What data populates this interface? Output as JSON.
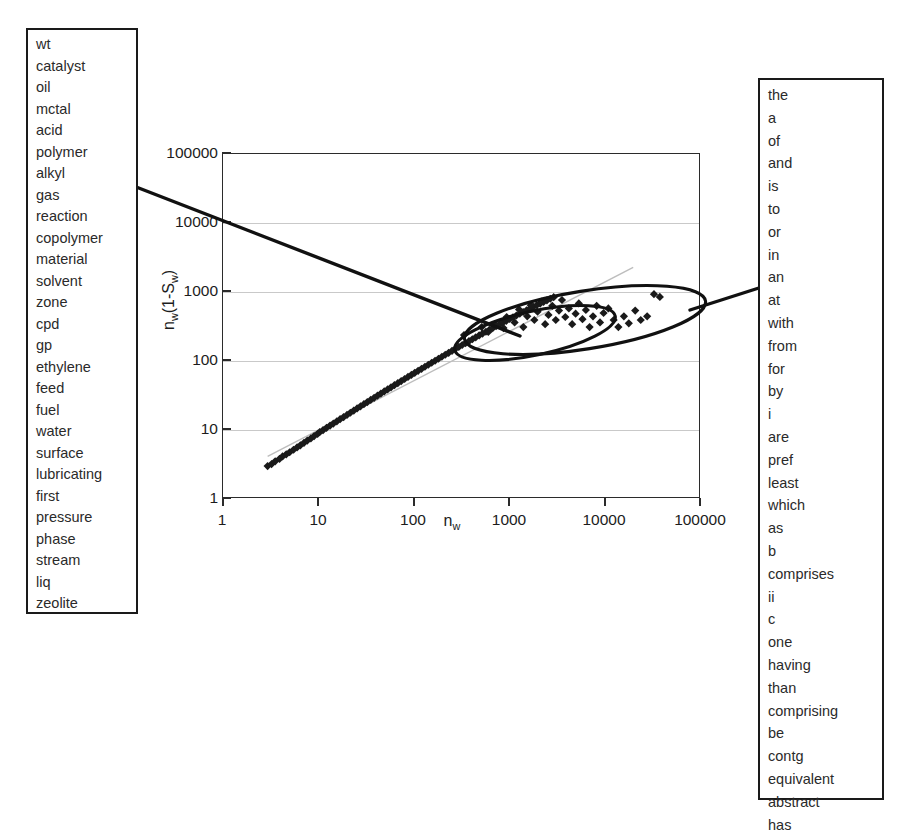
{
  "left_word_list": {
    "name": "left-term-cluster",
    "words": [
      "wt",
      "catalyst",
      "oil",
      "mctal",
      "acid",
      "polymer",
      "alkyl",
      "gas",
      "reaction",
      "copolymer",
      "material",
      "solvent",
      "zone",
      "cpd",
      "gp",
      "ethylene",
      "feed",
      "fuel",
      "water",
      "surface",
      "lubricating",
      "first",
      "pressure",
      "phase",
      "stream",
      "liq",
      "zeolite"
    ]
  },
  "right_word_list": {
    "name": "right-term-cluster",
    "words": [
      "the",
      "a",
      "of",
      "and",
      "is",
      "to",
      "or",
      "in",
      "an",
      "at",
      "with",
      "from",
      "for",
      "by",
      "i",
      "are",
      "pref",
      "least",
      "which",
      "as",
      "b",
      "comprises",
      "ii",
      "c",
      "one",
      "having",
      "than",
      "comprising",
      "be",
      "contg",
      "equivalent",
      "abstract",
      "has"
    ]
  },
  "chart_data": {
    "type": "scatter",
    "title": "",
    "xlabel": "n_w",
    "xlabel_html": "n<sub>w</sub>",
    "ylabel": "n_w(1-S_w)",
    "ylabel_html": "n<sub>w</sub>(1-S<sub>w</sub>)",
    "xscale": "log",
    "yscale": "log",
    "xlim": [
      1,
      100000
    ],
    "ylim": [
      1,
      100000
    ],
    "grid": true,
    "legend": "none",
    "xticks": [
      "1",
      "10",
      "100",
      "1000",
      "10000",
      "100000"
    ],
    "yticks": [
      "1",
      "10",
      "100",
      "1000",
      "10000",
      "100000"
    ],
    "xtick_values": [
      1,
      10,
      100,
      1000,
      10000,
      100000
    ],
    "ytick_values": [
      1,
      10,
      100,
      1000,
      10000,
      100000
    ],
    "marker": "diamond",
    "marker_color": "#1a1a1a",
    "reference_line": {
      "note": "faint diagonal guide line above main band",
      "from": [
        3,
        4
      ],
      "to": [
        20000,
        2200
      ],
      "color": "#bdbdbd"
    },
    "points": [
      [
        3.0,
        2.9
      ],
      [
        3.3,
        3.1
      ],
      [
        3.6,
        3.4
      ],
      [
        4.0,
        3.7
      ],
      [
        4.3,
        4.0
      ],
      [
        4.7,
        4.3
      ],
      [
        5.1,
        4.6
      ],
      [
        5.6,
        5.0
      ],
      [
        6.1,
        5.4
      ],
      [
        6.6,
        5.8
      ],
      [
        7.2,
        6.3
      ],
      [
        7.8,
        6.8
      ],
      [
        8.5,
        7.3
      ],
      [
        9.2,
        7.9
      ],
      [
        10.0,
        8.5
      ],
      [
        10.5,
        9.0
      ],
      [
        11.4,
        9.6
      ],
      [
        12.4,
        10.4
      ],
      [
        13.5,
        11.2
      ],
      [
        14.6,
        12.0
      ],
      [
        15.9,
        12.9
      ],
      [
        17.2,
        13.9
      ],
      [
        18.7,
        14.9
      ],
      [
        20.3,
        16.0
      ],
      [
        22.0,
        17.2
      ],
      [
        23.9,
        18.5
      ],
      [
        25.9,
        19.9
      ],
      [
        28.1,
        21.3
      ],
      [
        30.5,
        22.9
      ],
      [
        33.1,
        24.6
      ],
      [
        35.9,
        26.4
      ],
      [
        39.0,
        28.3
      ],
      [
        42.3,
        30.4
      ],
      [
        45.9,
        32.6
      ],
      [
        49.8,
        35.0
      ],
      [
        54.0,
        37.5
      ],
      [
        58.6,
        40.2
      ],
      [
        63.6,
        43.1
      ],
      [
        69.0,
        46.2
      ],
      [
        74.9,
        49.5
      ],
      [
        81.3,
        53.0
      ],
      [
        88.2,
        56.8
      ],
      [
        95.7,
        60.8
      ],
      [
        103.8,
        65.1
      ],
      [
        112.6,
        69.7
      ],
      [
        122.2,
        74.6
      ],
      [
        132.6,
        79.8
      ],
      [
        143.9,
        85.4
      ],
      [
        156.1,
        91.3
      ],
      [
        169.4,
        97.6
      ],
      [
        183.8,
        104.3
      ],
      [
        199.4,
        111.5
      ],
      [
        216.4,
        119.1
      ],
      [
        234.8,
        127.2
      ],
      [
        254.8,
        135.8
      ],
      [
        276.4,
        145.0
      ],
      [
        299.9,
        154.7
      ],
      [
        325.4,
        165.0
      ],
      [
        353.1,
        176.0
      ],
      [
        383.1,
        187.6
      ],
      [
        415.7,
        199.9
      ],
      [
        451.0,
        212.9
      ],
      [
        489.4,
        226.7
      ],
      [
        531.0,
        241.3
      ],
      [
        576.2,
        256.8
      ],
      [
        625.2,
        273.1
      ],
      [
        678.4,
        290.4
      ],
      [
        736.1,
        308.7
      ],
      [
        798.7,
        328.0
      ],
      [
        866.6,
        348.4
      ],
      [
        940.3,
        369.9
      ],
      [
        1020.2,
        392.6
      ],
      [
        1107.0,
        416.6
      ],
      [
        1201.1,
        441.8
      ],
      [
        1303.3,
        468.4
      ],
      [
        1414.2,
        496.3
      ],
      [
        1534.5,
        525.6
      ],
      [
        1665.0,
        556.3
      ],
      [
        1806.6,
        588.6
      ],
      [
        1960.3,
        622.3
      ],
      [
        2127.0,
        657.6
      ],
      [
        2307.9,
        694.4
      ],
      [
        2504.2,
        732.8
      ],
      [
        2717.2,
        772.7
      ],
      [
        2948.3,
        814.1
      ],
      [
        340.0,
        230.0
      ],
      [
        520.0,
        300.0
      ],
      [
        610.0,
        255.0
      ],
      [
        720.0,
        330.0
      ],
      [
        880.0,
        290.0
      ],
      [
        950.0,
        420.0
      ],
      [
        1150.0,
        350.0
      ],
      [
        1280.0,
        540.0
      ],
      [
        1420.0,
        300.0
      ],
      [
        1560.0,
        430.0
      ],
      [
        1700.0,
        620.0
      ],
      [
        1850.0,
        380.0
      ],
      [
        2000.0,
        500.0
      ],
      [
        2200.0,
        700.0
      ],
      [
        2400.0,
        330.0
      ],
      [
        2600.0,
        450.0
      ],
      [
        2850.0,
        610.0
      ],
      [
        3100.0,
        380.0
      ],
      [
        3350.0,
        520.0
      ],
      [
        3600.0,
        740.0
      ],
      [
        3900.0,
        420.0
      ],
      [
        4250.0,
        560.0
      ],
      [
        4600.0,
        330.0
      ],
      [
        5000.0,
        470.0
      ],
      [
        5400.0,
        660.0
      ],
      [
        5900.0,
        390.0
      ],
      [
        6400.0,
        530.0
      ],
      [
        7000.0,
        300.0
      ],
      [
        7600.0,
        430.0
      ],
      [
        8300.0,
        610.0
      ],
      [
        9000.0,
        350.0
      ],
      [
        9800.0,
        480.0
      ],
      [
        11000.0,
        560.0
      ],
      [
        12500.0,
        380.0
      ],
      [
        14000.0,
        300.0
      ],
      [
        16000.0,
        430.0
      ],
      [
        18000.0,
        340.0
      ],
      [
        21000.0,
        520.0
      ],
      [
        24000.0,
        380.0
      ],
      [
        28000.0,
        430.0
      ],
      [
        33000.0,
        900.0
      ],
      [
        38000.0,
        820.0
      ]
    ],
    "annotations": [
      {
        "name": "inner-ellipse",
        "shape": "ellipse",
        "note": "hand-drawn ring around dense upper cluster"
      },
      {
        "name": "outer-ellipse",
        "shape": "ellipse",
        "note": "hand-drawn ring around extended upper-right cluster"
      },
      {
        "name": "left-leader-line",
        "shape": "line",
        "note": "connects left word box to inner cluster"
      },
      {
        "name": "right-leader-line",
        "shape": "line",
        "note": "connects outer cluster to right word box"
      }
    ]
  }
}
